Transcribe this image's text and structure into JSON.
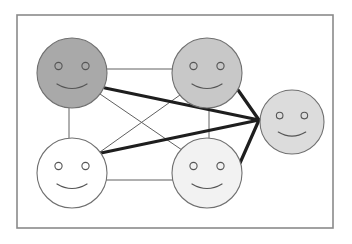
{
  "diagram": {
    "type": "social-network-graph",
    "frame": {
      "x": 17,
      "y": 15,
      "width": 316,
      "height": 213
    },
    "faces": [
      {
        "id": "face-top-left",
        "cx": 72,
        "cy": 73,
        "r": 35,
        "fill": "#a9a9a9",
        "expression": "smile"
      },
      {
        "id": "face-top-middle",
        "cx": 207,
        "cy": 73,
        "r": 35,
        "fill": "#c8c8c8",
        "expression": "smile"
      },
      {
        "id": "face-right",
        "cx": 292,
        "cy": 122,
        "r": 32,
        "fill": "#dcdcdc",
        "expression": "smile"
      },
      {
        "id": "face-bottom-left",
        "cx": 72,
        "cy": 173,
        "r": 35,
        "fill": "#ffffff",
        "expression": "smile"
      },
      {
        "id": "face-bottom-middle",
        "cx": 207,
        "cy": 173,
        "r": 35,
        "fill": "#f2f2f2",
        "expression": "smile"
      }
    ],
    "thin_edges": [
      [
        "face-top-left",
        "face-top-middle"
      ],
      [
        "face-top-left",
        "face-bottom-left"
      ],
      [
        "face-top-middle",
        "face-bottom-middle"
      ],
      [
        "face-bottom-left",
        "face-bottom-middle"
      ],
      [
        "face-top-left",
        "face-bottom-middle"
      ],
      [
        "face-top-middle",
        "face-bottom-left"
      ]
    ],
    "thick_edges": [
      [
        "face-top-left",
        "face-right"
      ],
      [
        "face-top-middle",
        "face-right"
      ],
      [
        "face-bottom-left",
        "face-right"
      ],
      [
        "face-bottom-middle",
        "face-right"
      ]
    ],
    "colors": {
      "frame_stroke": "#8a8a8a",
      "thin_edge": "#606060",
      "thick_edge": "#1e1e1e",
      "face_outline": "#707070"
    }
  }
}
